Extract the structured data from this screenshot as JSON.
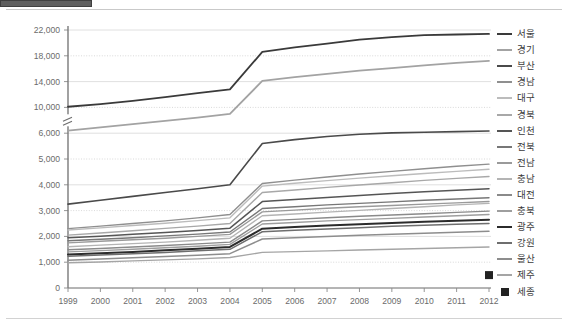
{
  "page": {
    "tab_fragment_color": "#5e5e5e",
    "background": "#ffffff"
  },
  "chart_data": {
    "type": "line",
    "title": "",
    "subtitle": "",
    "xlabel": "",
    "ylabel": "",
    "grid": true,
    "legend_position": "right",
    "axis_break": {
      "present": true,
      "between": [
        6000,
        10000
      ],
      "note": "y-axis broken between 6,000 and 10,000"
    },
    "x": [
      1999,
      2000,
      2001,
      2002,
      2003,
      2004,
      2005,
      2006,
      2007,
      2008,
      2009,
      2010,
      2011,
      2012
    ],
    "xticklabels": [
      "1999",
      "2000",
      "2001",
      "2002",
      "2003",
      "2004",
      "2005",
      "2006",
      "2007",
      "2008",
      "2009",
      "2010",
      "2011",
      "2012"
    ],
    "yticklabels": [
      "0",
      "1,000",
      "2,000",
      "3,000",
      "4,000",
      "5,000",
      "6,000",
      "10,000",
      "14,000",
      "18,000",
      "22,000"
    ],
    "ytickvalues": [
      0,
      1000,
      2000,
      3000,
      4000,
      5000,
      6000,
      10000,
      14000,
      18000,
      22000
    ],
    "ylim": [
      0,
      22500
    ],
    "series": [
      {
        "name": "서울",
        "color": "#3a3a3a",
        "width": 1.8,
        "values": [
          10100,
          10500,
          11000,
          11600,
          12200,
          12800,
          18600,
          19300,
          19900,
          20500,
          20900,
          21200,
          21300,
          21400
        ]
      },
      {
        "name": "경기",
        "color": "#a3a3a3",
        "width": 1.8,
        "values": [
          6400,
          6900,
          7400,
          7900,
          8400,
          9000,
          14100,
          14700,
          15200,
          15700,
          16100,
          16500,
          16900,
          17200
        ]
      },
      {
        "name": "부산",
        "color": "#4a4a4a",
        "width": 1.6,
        "values": [
          3250,
          3400,
          3550,
          3700,
          3850,
          4000,
          5600,
          5750,
          5870,
          5960,
          6050,
          6150,
          6250,
          6350
        ]
      },
      {
        "name": "경남",
        "color": "#8f8f8f",
        "width": 1.4,
        "values": [
          2300,
          2400,
          2500,
          2600,
          2720,
          2850,
          4050,
          4180,
          4300,
          4420,
          4520,
          4620,
          4720,
          4800
        ]
      },
      {
        "name": "대구",
        "color": "#bcbcbc",
        "width": 1.4,
        "values": [
          2250,
          2330,
          2420,
          2510,
          2610,
          2720,
          3950,
          4060,
          4160,
          4260,
          4350,
          4440,
          4520,
          4600
        ]
      },
      {
        "name": "경북",
        "color": "#a8a8a8",
        "width": 1.4,
        "values": [
          2050,
          2130,
          2220,
          2310,
          2400,
          2500,
          3700,
          3800,
          3900,
          3990,
          4080,
          4170,
          4250,
          4320
        ]
      },
      {
        "name": "인천",
        "color": "#555555",
        "width": 1.5,
        "values": [
          1950,
          2010,
          2080,
          2150,
          2230,
          2320,
          3350,
          3430,
          3510,
          3590,
          3660,
          3730,
          3790,
          3850
        ]
      },
      {
        "name": "전북",
        "color": "#777777",
        "width": 1.4,
        "values": [
          1830,
          1890,
          1950,
          2020,
          2090,
          2170,
          3080,
          3150,
          3220,
          3280,
          3340,
          3400,
          3450,
          3500
        ]
      },
      {
        "name": "전남",
        "color": "#9a9a9a",
        "width": 1.4,
        "values": [
          1750,
          1810,
          1870,
          1930,
          2000,
          2080,
          2950,
          3020,
          3090,
          3150,
          3200,
          3250,
          3300,
          3350
        ]
      },
      {
        "name": "충남",
        "color": "#b4b4b4",
        "width": 1.4,
        "values": [
          1600,
          1660,
          1720,
          1780,
          1850,
          1930,
          2800,
          2870,
          2940,
          3010,
          3080,
          3150,
          3220,
          3280
        ]
      },
      {
        "name": "대전",
        "color": "#8a8a8a",
        "width": 1.4,
        "values": [
          1480,
          1530,
          1590,
          1650,
          1710,
          1780,
          2600,
          2660,
          2720,
          2780,
          2830,
          2880,
          2930,
          2980
        ]
      },
      {
        "name": "충북",
        "color": "#9e9e9e",
        "width": 1.4,
        "values": [
          1400,
          1450,
          1500,
          1560,
          1620,
          1690,
          2480,
          2540,
          2600,
          2650,
          2700,
          2750,
          2800,
          2850
        ]
      },
      {
        "name": "광주",
        "color": "#2b2b2b",
        "width": 2.0,
        "values": [
          1300,
          1350,
          1400,
          1460,
          1520,
          1590,
          2300,
          2360,
          2420,
          2470,
          2520,
          2570,
          2610,
          2650
        ]
      },
      {
        "name": "강원",
        "color": "#6e6e6e",
        "width": 1.5,
        "values": [
          1230,
          1280,
          1330,
          1380,
          1440,
          1500,
          2180,
          2240,
          2290,
          2340,
          2390,
          2430,
          2470,
          2500
        ]
      },
      {
        "name": "울산",
        "color": "#8d8d8d",
        "width": 1.5,
        "values": [
          1080,
          1120,
          1170,
          1220,
          1270,
          1330,
          1900,
          1950,
          2000,
          2040,
          2080,
          2120,
          2160,
          2200
        ]
      },
      {
        "name": "제주",
        "color": "#a5a5a5",
        "width": 1.4,
        "values": [
          980,
          1010,
          1050,
          1090,
          1130,
          1180,
          1380,
          1410,
          1440,
          1470,
          1500,
          1530,
          1560,
          1590
        ]
      },
      {
        "name": "세종",
        "color": "#222222",
        "width": 0,
        "marker": "square",
        "values": [
          null,
          null,
          null,
          null,
          null,
          null,
          null,
          null,
          null,
          null,
          null,
          null,
          null,
          500
        ]
      }
    ]
  },
  "legend": {
    "items": [
      {
        "label": "서울",
        "color": "#3a3a3a",
        "thickness": 2.4,
        "marker": "line"
      },
      {
        "label": "경기",
        "color": "#a3a3a3",
        "thickness": 2.2,
        "marker": "line"
      },
      {
        "label": "부산",
        "color": "#4a4a4a",
        "thickness": 2.4,
        "marker": "line"
      },
      {
        "label": "경남",
        "color": "#8f8f8f",
        "thickness": 2.0,
        "marker": "line"
      },
      {
        "label": "대구",
        "color": "#bcbcbc",
        "thickness": 2.0,
        "marker": "line"
      },
      {
        "label": "경북",
        "color": "#a8a8a8",
        "thickness": 2.0,
        "marker": "line"
      },
      {
        "label": "인천",
        "color": "#555555",
        "thickness": 2.4,
        "marker": "line"
      },
      {
        "label": "전북",
        "color": "#777777",
        "thickness": 2.2,
        "marker": "line"
      },
      {
        "label": "전남",
        "color": "#9a9a9a",
        "thickness": 2.2,
        "marker": "line"
      },
      {
        "label": "충남",
        "color": "#b4b4b4",
        "thickness": 2.0,
        "marker": "line"
      },
      {
        "label": "대전",
        "color": "#8a8a8a",
        "thickness": 2.2,
        "marker": "line"
      },
      {
        "label": "충북",
        "color": "#9e9e9e",
        "thickness": 2.2,
        "marker": "line"
      },
      {
        "label": "광주",
        "color": "#2b2b2b",
        "thickness": 2.8,
        "marker": "line"
      },
      {
        "label": "강원",
        "color": "#6e6e6e",
        "thickness": 2.4,
        "marker": "line"
      },
      {
        "label": "울산",
        "color": "#8d8d8d",
        "thickness": 2.2,
        "marker": "line"
      },
      {
        "label": "제주",
        "color": "#a5a5a5",
        "thickness": 2.2,
        "marker": "line"
      },
      {
        "label": "세종",
        "color": "#222222",
        "thickness": 0,
        "marker": "square"
      }
    ]
  }
}
